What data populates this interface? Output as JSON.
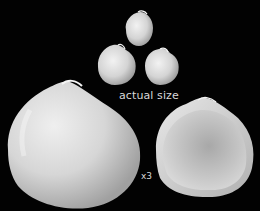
{
  "image": {
    "description": "Four white bivalve shells on black background: three small shells at actual size grouped at top center, two enlarged shells (x3) below",
    "background_color": "#020202",
    "labels": {
      "actual_size": "actual size",
      "magnification": "x3"
    },
    "shells": [
      {
        "name": "small-shell-top",
        "group": "actual size"
      },
      {
        "name": "small-shell-left",
        "group": "actual size"
      },
      {
        "name": "small-shell-right",
        "group": "actual size"
      },
      {
        "name": "large-shell-exterior",
        "group": "x3"
      },
      {
        "name": "large-shell-interior",
        "group": "x3"
      }
    ]
  }
}
